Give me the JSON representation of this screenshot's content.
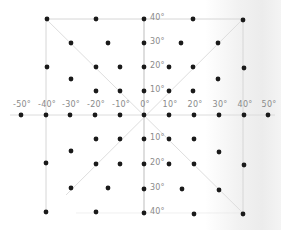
{
  "diagram": {
    "type": "coordinate-grid-projection",
    "x_axis": {
      "labels": [
        "-50°",
        "-40°",
        "-30°",
        "-20°",
        "-10°",
        "0°",
        "10°",
        "20°",
        "30°",
        "40°",
        "50°"
      ],
      "label_x": [
        21,
        46,
        70,
        95,
        120,
        144,
        169,
        194,
        219,
        244,
        268
      ]
    },
    "y_axis": {
      "labels_upper": [
        "40°",
        "30°",
        "20°",
        "10°"
      ],
      "labels_lower": [
        "10°",
        "20°",
        "30°",
        "40°"
      ],
      "upper_y": [
        19,
        43,
        67,
        91
      ],
      "lower_y": [
        139,
        164,
        189,
        213
      ]
    },
    "frame": {
      "left": 46,
      "right": 243,
      "top": 19,
      "bottom": 213,
      "center_x": 144,
      "center_y": 115
    },
    "colors": {
      "dot": "#1a1a1a",
      "line": "#d6d6d6",
      "label": "#8a8a8a"
    },
    "dots": [
      [
        47,
        19
      ],
      [
        96,
        19
      ],
      [
        144,
        19
      ],
      [
        193,
        19
      ],
      [
        243,
        20
      ],
      [
        71,
        43
      ],
      [
        108,
        43
      ],
      [
        144,
        43
      ],
      [
        181,
        43
      ],
      [
        218,
        43
      ],
      [
        47,
        67
      ],
      [
        96,
        67
      ],
      [
        120,
        67
      ],
      [
        144,
        67
      ],
      [
        169,
        67
      ],
      [
        193,
        67
      ],
      [
        244,
        68
      ],
      [
        71,
        79
      ],
      [
        218,
        79
      ],
      [
        96,
        91
      ],
      [
        120,
        91
      ],
      [
        144,
        91
      ],
      [
        169,
        91
      ],
      [
        193,
        91
      ],
      [
        21,
        115
      ],
      [
        46,
        115
      ],
      [
        70,
        115
      ],
      [
        95,
        115
      ],
      [
        120,
        115
      ],
      [
        144,
        115
      ],
      [
        169,
        115
      ],
      [
        194,
        115
      ],
      [
        219,
        115
      ],
      [
        244,
        115
      ],
      [
        268,
        115
      ],
      [
        96,
        139
      ],
      [
        120,
        139
      ],
      [
        144,
        139
      ],
      [
        169,
        139
      ],
      [
        194,
        139
      ],
      [
        71,
        151
      ],
      [
        219,
        152
      ],
      [
        46,
        163
      ],
      [
        96,
        164
      ],
      [
        120,
        164
      ],
      [
        144,
        164
      ],
      [
        169,
        164
      ],
      [
        194,
        164
      ],
      [
        244,
        165
      ],
      [
        71,
        188
      ],
      [
        108,
        188
      ],
      [
        144,
        189
      ],
      [
        182,
        189
      ],
      [
        219,
        190
      ],
      [
        46,
        212
      ],
      [
        96,
        212
      ],
      [
        144,
        213
      ],
      [
        194,
        214
      ],
      [
        243,
        214
      ]
    ]
  }
}
